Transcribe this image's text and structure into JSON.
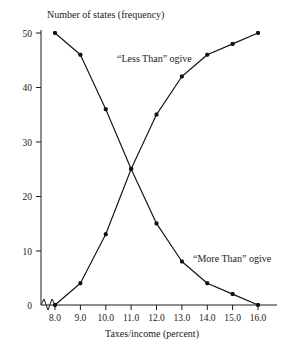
{
  "chart_data": {
    "type": "line",
    "title": "",
    "ylabel": "Number of states (frequency)",
    "xlabel": "Taxes/income (percent)",
    "x": [
      8.0,
      9.0,
      10.0,
      11.0,
      12.0,
      13.0,
      14.0,
      15.0,
      16.0
    ],
    "xtick_labels": [
      "8.0",
      "9.0",
      "10.0",
      "11.0",
      "12.0",
      "13.0",
      "14.0",
      "15.0",
      "16.0"
    ],
    "ytick_labels": [
      "0",
      "10",
      "20",
      "30",
      "40",
      "50"
    ],
    "yticks": [
      0,
      10,
      20,
      30,
      40,
      50
    ],
    "xlim": [
      8.0,
      16.0
    ],
    "ylim": [
      0,
      50
    ],
    "grid": false,
    "legend_position": "inline-annotations",
    "axis_break": true,
    "series": [
      {
        "name": "“Less Than” ogive",
        "values": [
          0,
          4,
          13,
          25,
          35,
          42,
          46,
          48,
          50
        ],
        "annotation": "“Less Than” ogive"
      },
      {
        "name": "“More Than” ogive",
        "values": [
          50,
          46,
          36,
          25,
          15,
          8,
          4,
          2,
          0
        ],
        "annotation": "“More Than” ogive"
      }
    ]
  },
  "axes": {
    "y_axis_title": "Number of states (frequency)",
    "x_axis_title": "Taxes/income (percent)"
  },
  "annotations": {
    "less_than": "“Less Than” ogive",
    "more_than": "“More Than” ogive"
  },
  "colors": {
    "ink": "#111111",
    "background": "#ffffff"
  }
}
